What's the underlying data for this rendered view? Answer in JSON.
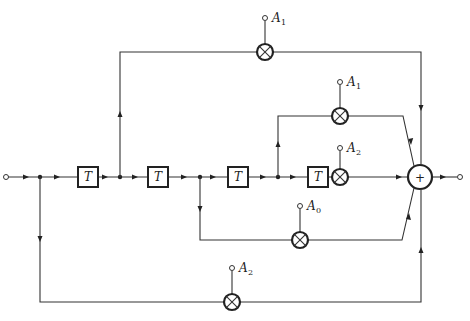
{
  "diagram": {
    "type": "FIR filter block diagram (tapped delay line)",
    "delay_label": "T",
    "delays": [
      {
        "id": "T1",
        "label": "T"
      },
      {
        "id": "T2",
        "label": "T"
      },
      {
        "id": "T3",
        "label": "T"
      },
      {
        "id": "T4",
        "label": "T"
      }
    ],
    "multipliers": [
      {
        "id": "mult-top",
        "coef": "A",
        "sub": "1"
      },
      {
        "id": "mult-upper-mid",
        "coef": "A",
        "sub": "1"
      },
      {
        "id": "mult-main",
        "coef": "A",
        "sub": "2"
      },
      {
        "id": "mult-lower-mid",
        "coef": "A",
        "sub": "0"
      },
      {
        "id": "mult-bottom",
        "coef": "A",
        "sub": "2"
      }
    ],
    "adder": {
      "symbol": "+"
    },
    "input": "input-terminal",
    "output": "output-terminal"
  }
}
